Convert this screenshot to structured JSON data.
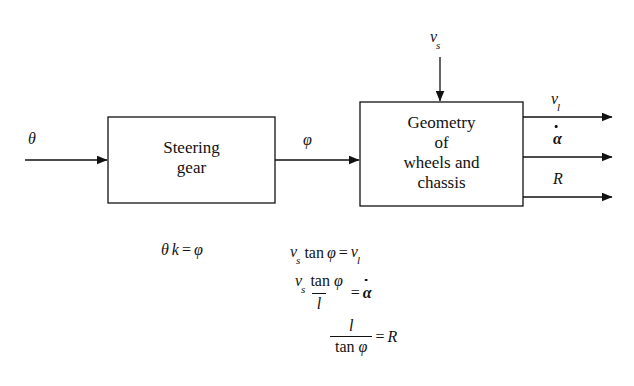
{
  "diagram": {
    "background": "#ffffff",
    "stroke": "#111111"
  },
  "blocks": [
    {
      "id": "steering-gear",
      "label": "Steering\ngear",
      "x": 108,
      "y": 117,
      "w": 167,
      "h": 86
    },
    {
      "id": "geometry",
      "label": "Geometry\nof\nwheels and\nchassis",
      "x": 360,
      "y": 102,
      "w": 163,
      "h": 104
    }
  ],
  "signals": {
    "input_theta": "θ",
    "intermediate_phi": "φ",
    "input_vs_base": "v",
    "input_vs_sub": "s",
    "output_vl_base": "v",
    "output_vl_sub": "l",
    "output_alphadot": "α",
    "output_R": "R"
  },
  "equations": {
    "steering": {
      "theta": "θ",
      "k": "k",
      "equals": "=",
      "phi": "φ"
    },
    "geometry": [
      {
        "id": "eq-vl",
        "v": "v",
        "v_sub": "s",
        "tan": "tan",
        "phi": "φ",
        "equals": "=",
        "rhs": "v",
        "rhs_sub": "l"
      },
      {
        "id": "eq-alphadot",
        "num_v": "v",
        "num_v_sub": "s",
        "num_tan": "tan",
        "num_phi": "φ",
        "den": "l",
        "equals": "=",
        "rhs": "α"
      },
      {
        "id": "eq-R",
        "num": "l",
        "den_tan": "tan",
        "den_phi": "φ",
        "equals": "=",
        "rhs": "R"
      }
    ]
  }
}
